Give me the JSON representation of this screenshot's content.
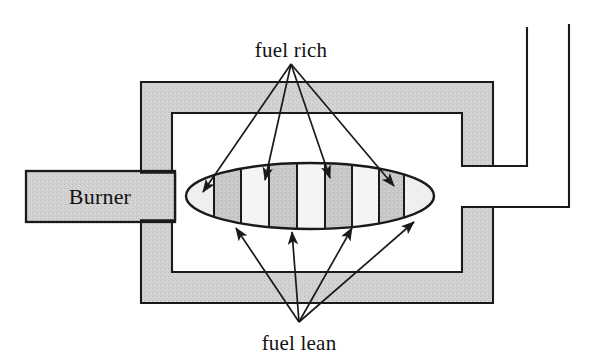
{
  "diagram": {
    "name": "combustion-chamber-schematic",
    "canvas": {
      "width": 597,
      "height": 362,
      "background": "#ffffff"
    },
    "colors": {
      "stroke": "#1a1a1a",
      "wall_fill": "#d2d2d2",
      "burner_fill": "#cccccc",
      "stripe_dark": "#c9c9c9",
      "stripe_light": "#f2f2f2",
      "flame_nose": "#ededed",
      "text": "#111111"
    },
    "labels": {
      "top": "fuel rich",
      "bottom": "fuel lean",
      "burner": "Burner"
    },
    "burner": {
      "label": "Burner",
      "x": 26,
      "y": 171,
      "width": 149,
      "height": 51
    },
    "outer_chamber": {
      "x": 141,
      "y": 82,
      "width": 352,
      "height": 221,
      "wall_thickness": 31
    },
    "inner_chamber": {
      "x": 172,
      "y": 113,
      "width": 290,
      "height": 159
    },
    "flame": {
      "cx": 310,
      "cy": 196,
      "rx": 124,
      "ry": 33,
      "stripe_boundaries": [
        214,
        241,
        269,
        297,
        325,
        352,
        379,
        404
      ],
      "stripe_pattern": [
        "light",
        "dark",
        "light",
        "dark",
        "light",
        "dark",
        "light",
        "dark",
        "light"
      ],
      "stripe_count": 9
    },
    "exit_duct": {
      "inner_line_x": 527,
      "inner_line_top_y": 27,
      "outer_line_x": 569,
      "outer_line_top_y": 24,
      "upper_port_y": 166,
      "lower_port_y": 207
    },
    "arrows_fuel_rich": {
      "apex": {
        "x": 291,
        "y": 64
      },
      "count": 4,
      "tips": [
        {
          "x": 203,
          "y": 192
        },
        {
          "x": 265,
          "y": 180
        },
        {
          "x": 330,
          "y": 178
        },
        {
          "x": 394,
          "y": 186
        }
      ]
    },
    "arrows_fuel_lean": {
      "apex": {
        "x": 299,
        "y": 322
      },
      "count": 4,
      "tips": [
        {
          "x": 236,
          "y": 228
        },
        {
          "x": 292,
          "y": 232
        },
        {
          "x": 352,
          "y": 228
        },
        {
          "x": 414,
          "y": 222
        }
      ]
    }
  }
}
